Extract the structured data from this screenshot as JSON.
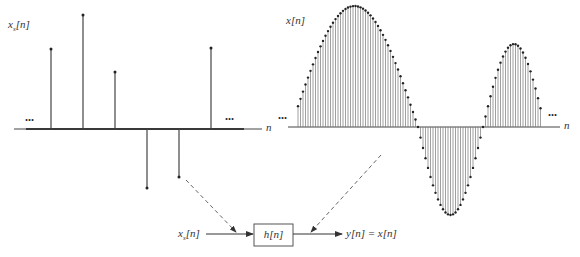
{
  "left_plot": {
    "label": "x",
    "label_sub": "s",
    "label_arg": "[n]",
    "axis_label": "n",
    "ellipsis_left": "...",
    "ellipsis_right": "...",
    "axis_y": 129,
    "axis_x_start": 14,
    "axis_x_end": 262,
    "nonzero_samples": [
      {
        "x": 51,
        "y_top": 49
      },
      {
        "x": 83,
        "y_top": 15
      },
      {
        "x": 115,
        "y_top": 72
      },
      {
        "x": 147,
        "y_top": 188
      },
      {
        "x": 179,
        "y_top": 177
      },
      {
        "x": 211,
        "y_top": 48
      }
    ],
    "zero_sample_range": [
      27,
      243
    ],
    "zero_sample_spacing": 2
  },
  "right_plot": {
    "label": "x[n]",
    "axis_label": "n",
    "ellipsis_left": "...",
    "ellipsis_right": "...",
    "axis_y": 127,
    "axis_x_start": 288,
    "axis_x_end": 560,
    "sample_spacing": 2.5,
    "segments": [
      {
        "x0": 291,
        "x1": 418,
        "amplitude": 121,
        "sign": 1
      },
      {
        "x0": 418,
        "x1": 483,
        "amplitude": 88,
        "sign": -1
      },
      {
        "x0": 483,
        "x1": 545,
        "amplitude": 83,
        "sign": 1
      }
    ],
    "first_sample_x": 298,
    "last_sample_x": 541
  },
  "block_diagram": {
    "input_label": "x",
    "input_sub": "s",
    "input_arg": "[n]",
    "block_label": "h[n]",
    "output_label": "y[n] = x[n]"
  },
  "chart_data": [
    {
      "type": "stem",
      "title": "x_s[n]",
      "xlabel": "n",
      "description": "Sampled (zero-filled) discrete-time signal: nonzero every 16th sample",
      "nonzero_values_relative": [
        0.8,
        1.13,
        0.57,
        -0.59,
        -0.48,
        0.81
      ]
    },
    {
      "type": "stem",
      "title": "x[n]",
      "xlabel": "n",
      "description": "Interpolated discrete-time signal: large positive lobe, negative lobe, smaller positive lobe",
      "lobes": [
        {
          "sign": "+",
          "relative_peak": 1.0
        },
        {
          "sign": "-",
          "relative_peak": 0.73
        },
        {
          "sign": "+",
          "relative_peak": 0.69
        }
      ]
    }
  ]
}
